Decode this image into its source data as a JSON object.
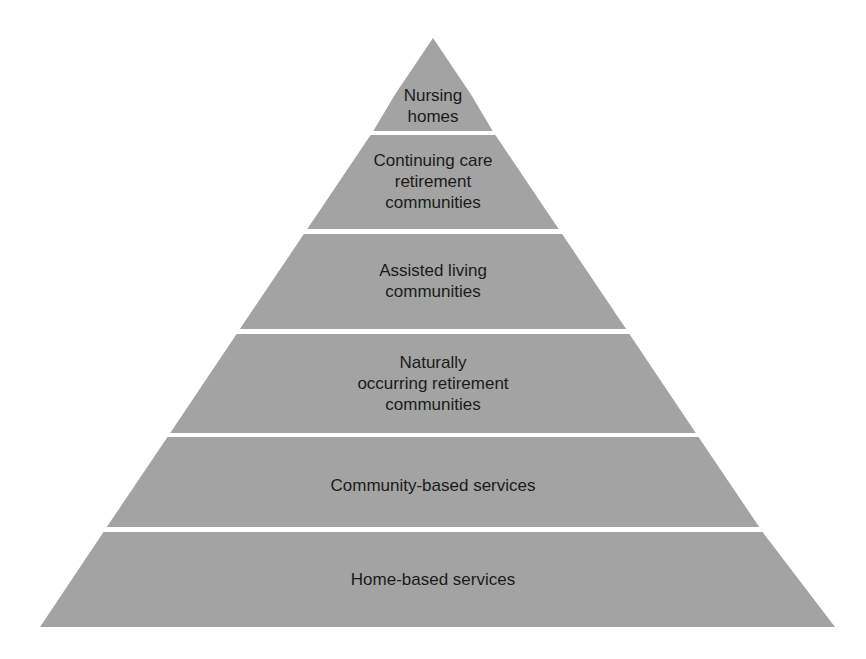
{
  "diagram": {
    "type": "pyramid",
    "fill_color": "#a3a3a3",
    "background_color": "#ffffff",
    "text_color": "#1b1b1b",
    "layers": [
      {
        "label": "Nursing\nhomes"
      },
      {
        "label": "Continuing care\nretirement\ncommunities"
      },
      {
        "label": "Assisted living\ncommunities"
      },
      {
        "label": "Naturally\noccurring retirement\ncommunities"
      },
      {
        "label": "Community-based services"
      },
      {
        "label": "Home-based services"
      }
    ]
  }
}
